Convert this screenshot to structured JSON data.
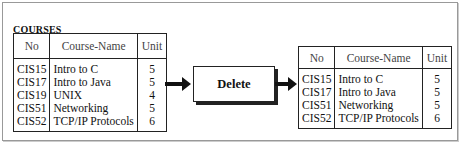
{
  "input_relation": {
    "name": "COURSES",
    "columns": [
      "No",
      "Course-Name",
      "Unit"
    ],
    "rows": [
      [
        "CIS15",
        "Intro to C",
        "5"
      ],
      [
        "CIS17",
        "Intro to Java",
        "5"
      ],
      [
        "CIS19",
        "UNIX",
        "4"
      ],
      [
        "CIS51",
        "Networking",
        "5"
      ],
      [
        "CIS52",
        "TCP/IP Protocols",
        "6"
      ]
    ]
  },
  "operation": {
    "label": "Delete"
  },
  "output_relation": {
    "columns": [
      "No",
      "Course-Name",
      "Unit"
    ],
    "rows": [
      [
        "CIS15",
        "Intro to C",
        "5"
      ],
      [
        "CIS17",
        "Intro to Java",
        "5"
      ],
      [
        "CIS51",
        "Networking",
        "5"
      ],
      [
        "CIS52",
        "TCP/IP Protocols",
        "6"
      ]
    ]
  }
}
